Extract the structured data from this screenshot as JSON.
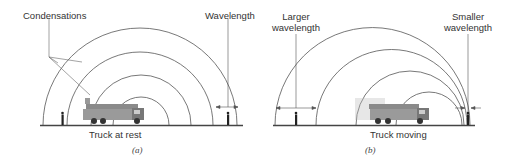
{
  "panel_a": {
    "caption": "(a)",
    "ground_label": "Truck at rest",
    "labels": {
      "condensations": "Condensations",
      "wavelength": "Wavelength"
    }
  },
  "panel_b": {
    "caption": "(b)",
    "ground_label": "Truck moving",
    "labels": {
      "larger_line1": "Larger",
      "larger_line2": "wavelength",
      "smaller_line1": "Smaller",
      "smaller_line2": "wavelength"
    }
  },
  "colors": {
    "wave": "#555555",
    "ground": "#444444",
    "truck": "#777777",
    "text": "#333333"
  }
}
